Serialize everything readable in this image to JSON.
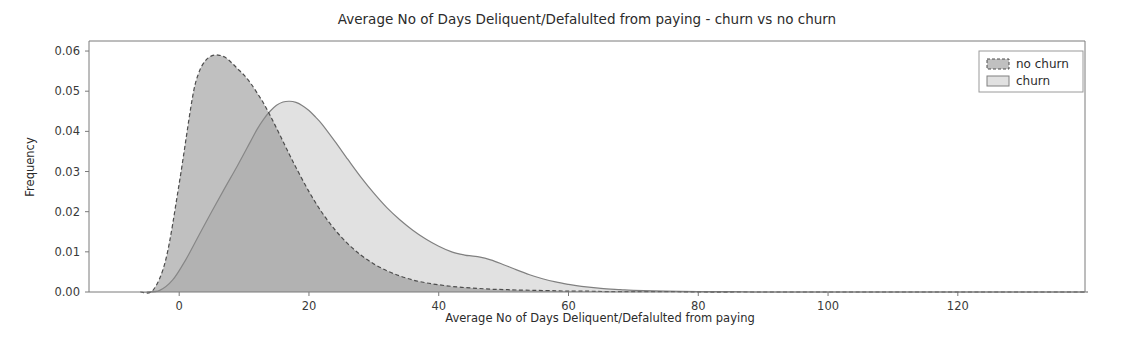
{
  "chart_data": {
    "type": "area",
    "title": "Average No of Days Deliquent/Defalulted from    paying - churn vs no churn",
    "xlabel": "Average No of Days Deliquent/Defalulted    from paying",
    "ylabel": "Frequency",
    "xlim": [
      -13.9,
      139.6
    ],
    "ylim": [
      0.0,
      0.0625
    ],
    "grid": false,
    "legend_position": "upper right",
    "xticks": [
      0,
      20,
      40,
      60,
      80,
      100,
      120
    ],
    "xtick_labels": [
      "0",
      "20",
      "40",
      "60",
      "80",
      "100",
      "120"
    ],
    "yticks": [
      0.0,
      0.01,
      0.02,
      0.03,
      0.04,
      0.05,
      0.06
    ],
    "ytick_labels": [
      "0.00",
      "0.01",
      "0.02",
      "0.03",
      "0.04",
      "0.05",
      "0.06"
    ],
    "series": [
      {
        "name": "no churn",
        "fill_color": "#8c8c8c",
        "fill_opacity": 0.55,
        "line_color": "#4d4d4d",
        "line_style": "dashed",
        "peak_x": 5.7,
        "peak_y": 0.059,
        "x": [
          -6,
          -4,
          -2,
          0,
          2,
          3,
          4,
          5,
          6,
          7,
          8,
          9,
          10,
          11,
          12,
          13,
          14,
          15,
          16,
          17,
          18,
          20,
          22,
          24,
          26,
          28,
          30,
          32,
          34,
          36,
          38,
          40,
          42,
          44,
          46,
          48,
          50,
          52,
          55,
          58,
          60,
          63,
          66,
          70,
          75,
          80,
          90,
          100,
          110,
          120,
          130,
          140
        ],
        "y": [
          0.0,
          0.0005,
          0.0085,
          0.027,
          0.048,
          0.0545,
          0.0575,
          0.0588,
          0.059,
          0.0585,
          0.0572,
          0.0556,
          0.054,
          0.052,
          0.0496,
          0.047,
          0.044,
          0.0408,
          0.0375,
          0.0342,
          0.031,
          0.025,
          0.0198,
          0.0155,
          0.012,
          0.0092,
          0.007,
          0.0053,
          0.004,
          0.003,
          0.0023,
          0.0018,
          0.0014,
          0.0011,
          0.0009,
          0.0007,
          0.0006,
          0.0005,
          0.0004,
          0.0003,
          0.0002,
          0.0002,
          0.0001,
          0.0001,
          0.0001,
          0.0,
          0.0,
          0.0,
          0.0,
          0.0,
          0.0,
          0.0
        ]
      },
      {
        "name": "churn",
        "fill_color": "#d9d9d9",
        "fill_opacity": 0.8,
        "line_color": "#808080",
        "line_style": "solid",
        "peak_x": 16.6,
        "peak_y": 0.0475,
        "x": [
          -5,
          -3,
          -1,
          1,
          3,
          5,
          7,
          9,
          11,
          12,
          13,
          14,
          15,
          16,
          17,
          18,
          19,
          20,
          21,
          22,
          24,
          26,
          28,
          30,
          32,
          34,
          36,
          38,
          40,
          42,
          44,
          45,
          46,
          48,
          50,
          52,
          54,
          56,
          58,
          60,
          62,
          65,
          68,
          70,
          75,
          80,
          85,
          90,
          100,
          110,
          120,
          130,
          140
        ],
        "y": [
          0.0,
          0.0004,
          0.003,
          0.008,
          0.014,
          0.02,
          0.0258,
          0.0315,
          0.0375,
          0.0405,
          0.043,
          0.045,
          0.0465,
          0.0473,
          0.0475,
          0.0472,
          0.0464,
          0.0452,
          0.0436,
          0.0418,
          0.0375,
          0.033,
          0.0286,
          0.0246,
          0.021,
          0.018,
          0.0154,
          0.0132,
          0.0114,
          0.01,
          0.0092,
          0.009,
          0.0088,
          0.008,
          0.0068,
          0.0055,
          0.0043,
          0.0033,
          0.0025,
          0.0019,
          0.0014,
          0.0009,
          0.0006,
          0.0004,
          0.0002,
          0.0001,
          0.0001,
          0.0,
          0.0,
          0.0,
          0.0,
          0.0,
          0.0
        ]
      }
    ]
  },
  "legend": {
    "entries": [
      {
        "label": "no churn"
      },
      {
        "label": "churn"
      }
    ]
  }
}
